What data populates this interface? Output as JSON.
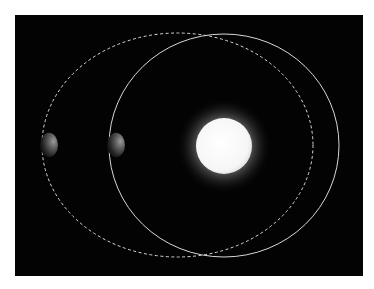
{
  "diagram": {
    "background_color": "#030303",
    "page_color": "#ffffff",
    "star": {
      "label": "",
      "cx": 224,
      "cy": 146,
      "r": 28,
      "glow_r": 48,
      "core_color": "#ffffff",
      "edge_color": "#e8e8e8"
    },
    "orbits": [
      {
        "name": "dashed-orbit",
        "style": "dashed",
        "cx": 177.5,
        "cy": 145,
        "rx": 135.5,
        "ry": 112,
        "color": "#d8d8d8"
      },
      {
        "name": "solid-orbit",
        "style": "solid",
        "cx": 224,
        "cy": 145.5,
        "rx": 115,
        "ry": 111.5,
        "color": "#d8d8d8"
      }
    ],
    "planets": [
      {
        "name": "planet-dashed-orbit",
        "cx": 49,
        "cy": 145,
        "r": 9
      },
      {
        "name": "planet-solid-orbit",
        "cx": 116,
        "cy": 145,
        "r": 9
      }
    ]
  }
}
